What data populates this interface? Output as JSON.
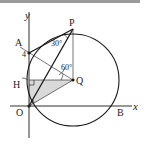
{
  "figure": {
    "axes": {
      "x_label": "x",
      "y_label": "y"
    },
    "points": {
      "A": {
        "label": "A",
        "x": 29,
        "y": 53
      },
      "P": {
        "label": "P",
        "x": 73,
        "y": 29
      },
      "Q": {
        "label": "Q",
        "x": 73,
        "y": 80
      },
      "H": {
        "label": "H",
        "x": 29,
        "y": 80
      },
      "O": {
        "label": "O",
        "x": 29,
        "y": 106
      },
      "B": {
        "label": "B",
        "x": 118,
        "y": 106
      }
    },
    "annotations": {
      "a_value": "4",
      "angle_apo": "30°",
      "angle_at_q": "60°"
    },
    "circle": {
      "center": "Q",
      "radius": 46
    },
    "colors": {
      "stroke": "#1a1a1a",
      "shade": "#d9d9d9",
      "topbar": "#9a9a9a"
    }
  }
}
